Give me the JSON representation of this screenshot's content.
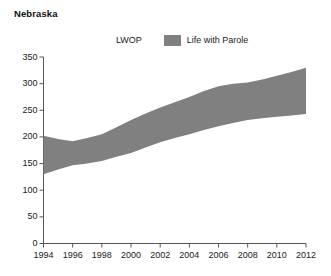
{
  "chart_title": "Nebraska",
  "legend": {
    "entries": [
      {
        "label": "LWOP",
        "swatch": "none",
        "color": ""
      },
      {
        "label": "Life with Parole",
        "swatch": "filled",
        "color": "#808080"
      }
    ]
  },
  "axis": {
    "y_ticks": [
      "0",
      "50",
      "100",
      "150",
      "200",
      "250",
      "300",
      "350"
    ],
    "x_ticks": [
      "1994",
      "1996",
      "1998",
      "2000",
      "2002",
      "2004",
      "2006",
      "2008",
      "2010",
      "2012"
    ]
  },
  "chart_data": {
    "type": "area",
    "title": "Nebraska",
    "xlabel": "",
    "ylabel": "",
    "xlim": [
      1994,
      2012
    ],
    "ylim": [
      0,
      350
    ],
    "grid": false,
    "legend_position": "top-center",
    "band_color": "#808080",
    "x": [
      1994,
      1995,
      1996,
      1997,
      1998,
      1999,
      2000,
      2001,
      2002,
      2003,
      2004,
      2005,
      2006,
      2007,
      2008,
      2009,
      2010,
      2011,
      2012
    ],
    "series": [
      {
        "name": "LWOP",
        "values": [
          130,
          139,
          147,
          150,
          155,
          163,
          170,
          180,
          190,
          198,
          205,
          213,
          220,
          226,
          232,
          235,
          238,
          240,
          243
        ]
      },
      {
        "name": "Life with Parole",
        "values": [
          202,
          196,
          192,
          198,
          205,
          218,
          232,
          244,
          255,
          265,
          275,
          286,
          295,
          300,
          302,
          308,
          315,
          322,
          330
        ]
      }
    ]
  }
}
